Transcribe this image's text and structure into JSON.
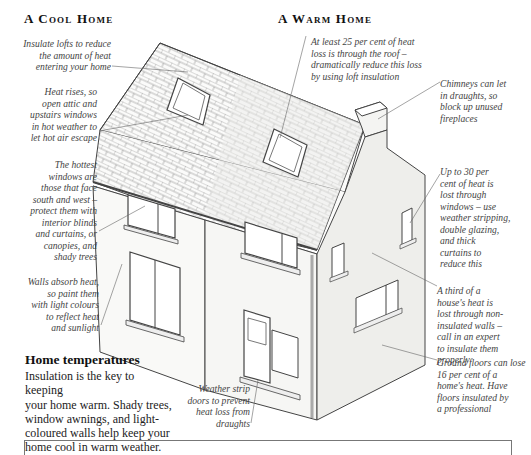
{
  "headings": {
    "cool_home": "A Cool Home",
    "warm_home": "A Warm Home"
  },
  "annotations": {
    "insulate_lofts": "Insulate lofts to reduce\nthe amount of heat\nentering your home",
    "heat_rises": "Heat rises, so\nopen attic and\nupstairs windows\nin hot weather to\nlet hot air escape",
    "hottest_windows": "The hottest\nwindows are\nthose that face\nsouth and west –\nprotect them with\ninterior blinds\nand curtains, or\ncanopies, and\nshady trees",
    "walls_absorb": "Walls absorb heat,\nso paint them\nwith light colours\nto reflect heat\nand sunlight",
    "roof_loss": "At least 25 per cent of heat\nloss is through the roof –\ndramatically reduce this loss\nby using loft insulation",
    "chimneys": "Chimneys can let\nin draughts, so\nblock up unused\nfireplaces",
    "windows_loss": "Up to 30 per\ncent of heat is\nlost through\nwindows – use\nweather stripping,\ndouble glazing,\nand thick\ncurtains to\nreduce this",
    "walls_loss": "A third of a\nhouse's heat is\nlost through non-\ninsulated walls –\ncall in an expert\nto insulate them\nproperly",
    "ground_floors": "Ground floors can lose\n16 per cent of a\nhome's heat. Have\nfloors insulated by\na professional",
    "weather_strip": "Weather strip\ndoors to prevent\nheat loss from\ndraughts"
  },
  "info_box": {
    "title": "Home temperatures",
    "body": "Insulation is the key to keeping\nyour home warm. Shady trees,\nwindow awnings, and light-\ncoloured walls help keep your\nhome cool in warm weather."
  },
  "colors": {
    "line": "#555555",
    "wall_front": "#f7f7f5",
    "wall_side": "#efefec",
    "roof": "#fbfbfa",
    "warm_roof": "#f1f1ee"
  }
}
